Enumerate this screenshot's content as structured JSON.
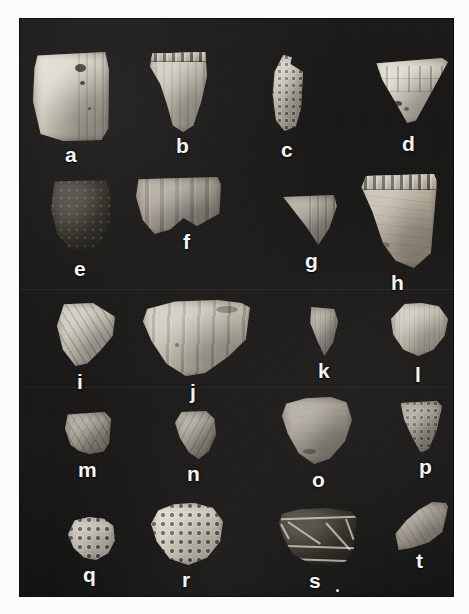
{
  "plate": {
    "kind": "archaeological-photo-plate",
    "background_color": "#141414",
    "page_background": "#fcfcfb",
    "label_color": "#f4f4f2",
    "rows": 5,
    "columns": 4,
    "sherd_count": 20,
    "stray_mark_note": "small white dot right of label s"
  },
  "sherds": [
    {
      "label": "a",
      "tone": "pale",
      "decoration": "vertical incised lines",
      "shape": "rectangular rim sherd"
    },
    {
      "label": "b",
      "tone": "light",
      "decoration": "notched rim with vertical incisions",
      "shape": "tapered rim sherd"
    },
    {
      "label": "c",
      "tone": "light",
      "decoration": "punctate / nodes",
      "shape": "narrow elongated sherd"
    },
    {
      "label": "d",
      "tone": "pale",
      "decoration": "rectangular impressed band",
      "shape": "triangular sherd"
    },
    {
      "label": "e",
      "tone": "vdark",
      "decoration": "eroded plain surface",
      "shape": "rounded body sherd"
    },
    {
      "label": "f",
      "tone": "mid",
      "decoration": "broad vertical grooves",
      "shape": "wide rim sherd"
    },
    {
      "label": "g",
      "tone": "mid",
      "decoration": "fine vertical incisions",
      "shape": "triangular sherd"
    },
    {
      "label": "h",
      "tone": "warm",
      "decoration": "notched/scalloped rim band",
      "shape": "trapezoidal rim sherd"
    },
    {
      "label": "i",
      "tone": "light",
      "decoration": "diagonal incised lines",
      "shape": "wedge sherd"
    },
    {
      "label": "j",
      "tone": "light",
      "decoration": "vertical incised lines below rim",
      "shape": "large rim sherd"
    },
    {
      "label": "k",
      "tone": "mid",
      "decoration": "fine vertical striations",
      "shape": "small triangular sherd"
    },
    {
      "label": "l",
      "tone": "light",
      "decoration": "fine vertical striations",
      "shape": "rounded sherd"
    },
    {
      "label": "m",
      "tone": "mid",
      "decoration": "crosshatch incision",
      "shape": "small square sherd"
    },
    {
      "label": "n",
      "tone": "mid",
      "decoration": "curved incised lines",
      "shape": "small sherd"
    },
    {
      "label": "o",
      "tone": "mid",
      "decoration": "plain burnished surface",
      "shape": "large rounded sherd"
    },
    {
      "label": "p",
      "tone": "mid",
      "decoration": "small punctate dots",
      "shape": "triangular sherd"
    },
    {
      "label": "q",
      "tone": "light",
      "decoration": "deep punctate dots",
      "shape": "small rounded sherd"
    },
    {
      "label": "r",
      "tone": "pale",
      "decoration": "dense punctate dot field",
      "shape": "rounded sherd"
    },
    {
      "label": "s",
      "tone": "vdark",
      "decoration": "painted light bands and chevron",
      "shape": "flaring rim sherd"
    },
    {
      "label": "t",
      "tone": "mid",
      "decoration": "plain, diagonal break",
      "shape": "flaring rim sherd"
    }
  ]
}
